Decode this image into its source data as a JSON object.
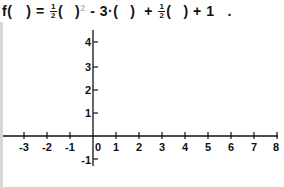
{
  "formula": {
    "prefix": "f(",
    "blank1": " ",
    "close1": ") =",
    "frac1_num": "1",
    "frac1_den": "2",
    "term1_open": "(",
    "blank2": " ",
    "term1_close": ")",
    "exponent": "2",
    "minus": "-",
    "coef2": "3·(",
    "blank3": " ",
    "term2_close": ")",
    "plus1": "+",
    "frac2_num": "1",
    "frac2_den": "2",
    "term3_open": "(",
    "blank4": " ",
    "term3_close": ")",
    "plus2": "+",
    "constant": "1",
    "period": "."
  },
  "chart_data": {
    "type": "line",
    "xlabel": "",
    "ylabel": "",
    "x_ticks": [
      "-3",
      "-2",
      "-1",
      "0",
      "1",
      "2",
      "3",
      "4",
      "5",
      "6",
      "7",
      "8"
    ],
    "y_ticks": [
      "-1",
      "1",
      "2",
      "3",
      "4"
    ],
    "xlim": [
      -3.5,
      8
    ],
    "ylim": [
      -1.3,
      4.6
    ],
    "grid": false,
    "series": []
  },
  "axes": {
    "x_labels": [
      {
        "label": "-3",
        "x": 24
      },
      {
        "label": "-2",
        "x": 47
      },
      {
        "label": "-1",
        "x": 70
      },
      {
        "label": "0",
        "x": 98
      },
      {
        "label": "1",
        "x": 116
      },
      {
        "label": "2",
        "x": 139
      },
      {
        "label": "3",
        "x": 162
      },
      {
        "label": "4",
        "x": 185
      },
      {
        "label": "5",
        "x": 208
      },
      {
        "label": "6",
        "x": 231
      },
      {
        "label": "7",
        "x": 254
      },
      {
        "label": "8",
        "x": 276
      }
    ],
    "y_labels": [
      {
        "label": "4",
        "y": 46
      },
      {
        "label": "3",
        "y": 71
      },
      {
        "label": "2",
        "y": 94
      },
      {
        "label": "1",
        "y": 117
      },
      {
        "label": "-1",
        "y": 164
      }
    ]
  }
}
